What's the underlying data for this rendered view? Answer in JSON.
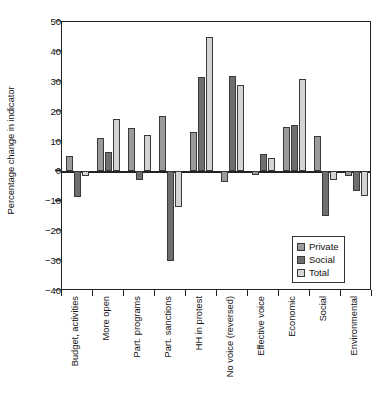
{
  "chart_data": {
    "type": "bar",
    "title": "",
    "xlabel": "",
    "ylabel": "Percentage change in indicator",
    "ylim": [
      -40,
      50
    ],
    "yticks": [
      50,
      40,
      30,
      20,
      10,
      0,
      -10,
      -20,
      -30,
      -40
    ],
    "ytick_labels": [
      "50",
      "40",
      "30",
      "20",
      "10",
      "0",
      "−10",
      "−20",
      "−30",
      "−40"
    ],
    "grid": false,
    "legend_position": "inside-bottom-right",
    "categories": [
      "Budget, activities",
      "More open",
      "Part. programs",
      "Part. sanctions",
      "HH in protest",
      "No voice (reversed)",
      "Effective voice",
      "Economic",
      "Social",
      "Environmental"
    ],
    "series": [
      {
        "name": "Private",
        "color": "#9a9a9a",
        "values": [
          5.2,
          11.3,
          14.5,
          18.6,
          13.2,
          -3.4,
          -1.3,
          14.8,
          12.0,
          -1.6
        ]
      },
      {
        "name": "Social",
        "color": "#6e6e6e",
        "values": [
          -8.4,
          6.5,
          -2.7,
          -29.9,
          31.5,
          32.1,
          5.9,
          15.6,
          -15.0,
          -6.6
        ]
      },
      {
        "name": "Total",
        "color": "#d4d4d4",
        "values": [
          -1.6,
          17.6,
          12.2,
          -11.9,
          45.0,
          28.9,
          4.5,
          30.9,
          -3.0,
          -8.1
        ]
      }
    ]
  },
  "legend": {
    "entries": [
      {
        "label": "Private"
      },
      {
        "label": "Social"
      },
      {
        "label": "Total"
      }
    ]
  }
}
